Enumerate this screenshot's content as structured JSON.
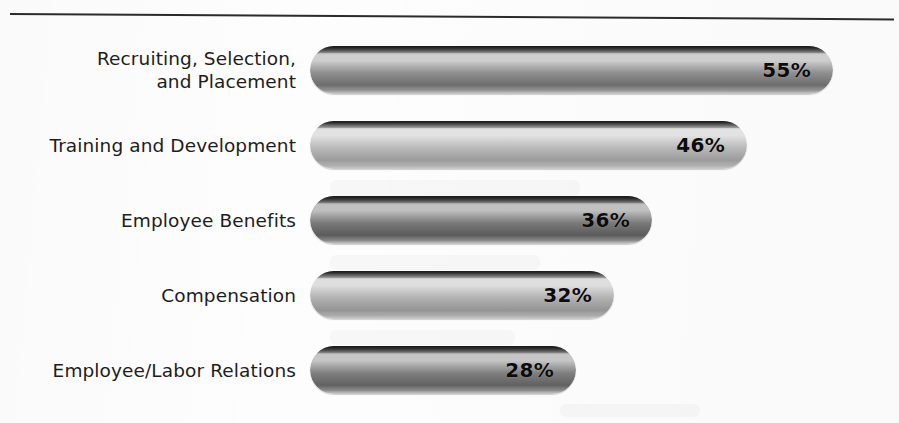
{
  "chart_data": {
    "type": "bar",
    "orientation": "horizontal",
    "title": "",
    "subtitle": "",
    "xlabel": "",
    "ylabel": "",
    "xlim": [
      0,
      62
    ],
    "grid": false,
    "legend": null,
    "value_suffix": "%",
    "categories": [
      "Recruiting, Selection,\nand Placement",
      "Training and Development",
      "Employee Benefits",
      "Compensation",
      "Employee/Labor Relations"
    ],
    "values": [
      55,
      46,
      36,
      32,
      28
    ],
    "value_labels": [
      "55%",
      "46%",
      "36%",
      "32%",
      "28%"
    ],
    "bar_colors": [
      "#8f8f8f",
      "#b9b9b9",
      "#7a7a7a",
      "#b2b2b2",
      "#808080"
    ],
    "bar_colors_light": [
      "#cfcfcf",
      "#e2e2e2",
      "#c0c0c0",
      "#dedede",
      "#c6c6c6"
    ],
    "bar_colors_dark": [
      "#6c6c6c",
      "#9b9b9b",
      "#5a5a5a",
      "#949494",
      "#606060"
    ]
  },
  "rule": {
    "color": "#2b2b2b"
  }
}
